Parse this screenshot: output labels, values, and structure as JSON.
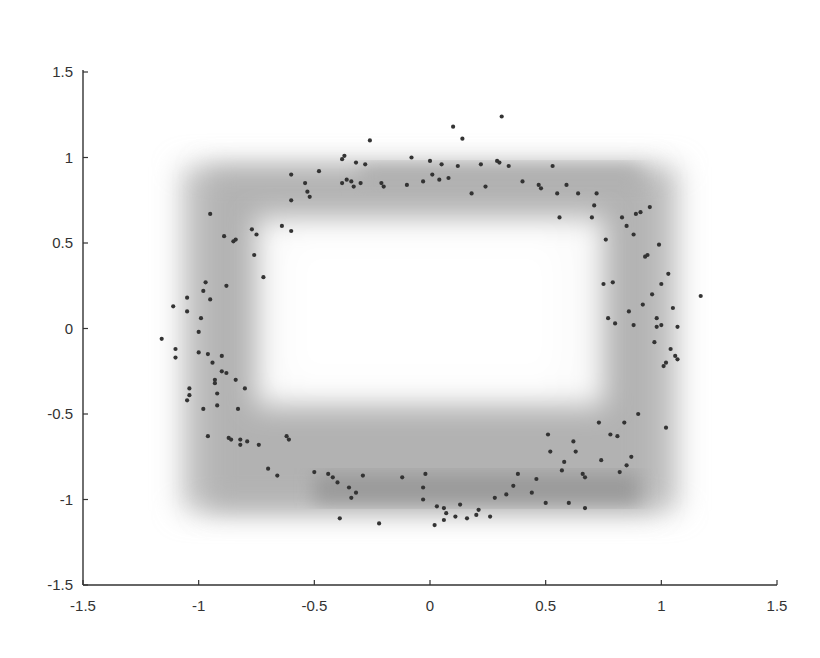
{
  "chart_data": {
    "type": "scatter",
    "title": "",
    "xlabel": "",
    "ylabel": "",
    "xlim": [
      -1.5,
      1.5
    ],
    "ylim": [
      -1.5,
      1.5
    ],
    "grid": false,
    "legend": null,
    "x_ticks": [
      -1.5,
      -1,
      -0.5,
      0,
      0.5,
      1,
      1.5
    ],
    "x_tick_labels": [
      "-1.5",
      "-1",
      "-0.5",
      "0",
      "0.5",
      "1",
      "1.5"
    ],
    "y_ticks": [
      -1.5,
      -1,
      -0.5,
      0,
      0.5,
      1,
      1.5
    ],
    "y_tick_labels": [
      "-1.5",
      "-1",
      "-0.5",
      "0",
      "0.5",
      "1",
      "1.5"
    ],
    "background_density": {
      "description": "blurred gray square-ring density centered at origin",
      "outer_extent": [
        -1.1,
        1.1,
        -1.1,
        0.98
      ],
      "inner_clear": [
        -0.75,
        0.75,
        -0.45,
        0.65
      ],
      "color": "#9a9a9a"
    },
    "marker_color": "#333333",
    "points": [
      [
        -1.16,
        -0.06
      ],
      [
        -1.11,
        0.13
      ],
      [
        -1.1,
        -0.12
      ],
      [
        -1.1,
        -0.17
      ],
      [
        -1.05,
        0.18
      ],
      [
        -1.05,
        0.1
      ],
      [
        -1.04,
        -0.35
      ],
      [
        -1.04,
        -0.39
      ],
      [
        -1.05,
        -0.42
      ],
      [
        -1.0,
        -0.14
      ],
      [
        -1.0,
        -0.02
      ],
      [
        -0.99,
        0.06
      ],
      [
        -0.98,
        0.22
      ],
      [
        -0.97,
        0.27
      ],
      [
        -0.98,
        -0.47
      ],
      [
        -0.96,
        -0.15
      ],
      [
        -0.96,
        -0.63
      ],
      [
        -0.95,
        0.67
      ],
      [
        -0.95,
        0.17
      ],
      [
        -0.94,
        -0.2
      ],
      [
        -0.93,
        -0.3
      ],
      [
        -0.93,
        -0.32
      ],
      [
        -0.92,
        -0.38
      ],
      [
        -0.92,
        -0.45
      ],
      [
        -0.9,
        -0.16
      ],
      [
        -0.9,
        -0.25
      ],
      [
        -0.89,
        0.54
      ],
      [
        -0.88,
        0.25
      ],
      [
        -0.88,
        -0.26
      ],
      [
        -0.87,
        -0.64
      ],
      [
        -0.86,
        -0.65
      ],
      [
        -0.85,
        0.51
      ],
      [
        -0.84,
        0.52
      ],
      [
        -0.84,
        -0.3
      ],
      [
        -0.83,
        -0.47
      ],
      [
        -0.82,
        -0.68
      ],
      [
        -0.82,
        -0.65
      ],
      [
        -0.8,
        -0.35
      ],
      [
        -0.79,
        -0.66
      ],
      [
        -0.77,
        0.58
      ],
      [
        -0.76,
        0.43
      ],
      [
        -0.75,
        0.55
      ],
      [
        -0.74,
        -0.68
      ],
      [
        -0.72,
        0.3
      ],
      [
        -0.7,
        -0.82
      ],
      [
        -0.66,
        -0.86
      ],
      [
        -0.64,
        0.6
      ],
      [
        -0.62,
        -0.63
      ],
      [
        -0.61,
        -0.65
      ],
      [
        -0.6,
        0.57
      ],
      [
        -0.6,
        0.9
      ],
      [
        -0.6,
        0.75
      ],
      [
        -0.54,
        0.85
      ],
      [
        -0.53,
        0.8
      ],
      [
        -0.52,
        0.77
      ],
      [
        -0.5,
        -0.84
      ],
      [
        -0.48,
        0.92
      ],
      [
        -0.44,
        -0.85
      ],
      [
        -0.42,
        -0.87
      ],
      [
        -0.4,
        -0.9
      ],
      [
        -0.39,
        -1.11
      ],
      [
        -0.38,
        0.85
      ],
      [
        -0.38,
        0.99
      ],
      [
        -0.37,
        1.01
      ],
      [
        -0.36,
        0.87
      ],
      [
        -0.35,
        -0.93
      ],
      [
        -0.34,
        -0.99
      ],
      [
        -0.34,
        0.86
      ],
      [
        -0.33,
        0.83
      ],
      [
        -0.32,
        -0.96
      ],
      [
        -0.32,
        0.97
      ],
      [
        -0.3,
        0.85
      ],
      [
        -0.29,
        -0.86
      ],
      [
        -0.28,
        0.96
      ],
      [
        -0.26,
        1.1
      ],
      [
        -0.22,
        -1.14
      ],
      [
        -0.21,
        0.85
      ],
      [
        -0.2,
        0.83
      ],
      [
        -0.12,
        -0.87
      ],
      [
        -0.1,
        0.84
      ],
      [
        -0.08,
        1.0
      ],
      [
        -0.03,
        -1.0
      ],
      [
        -0.03,
        -0.93
      ],
      [
        -0.03,
        0.86
      ],
      [
        -0.02,
        -0.85
      ],
      [
        0.0,
        0.98
      ],
      [
        0.01,
        0.9
      ],
      [
        0.02,
        -1.15
      ],
      [
        0.03,
        -1.04
      ],
      [
        0.04,
        0.87
      ],
      [
        0.05,
        0.96
      ],
      [
        0.06,
        -1.05
      ],
      [
        0.06,
        -1.12
      ],
      [
        0.07,
        -1.08
      ],
      [
        0.08,
        0.88
      ],
      [
        0.1,
        1.18
      ],
      [
        0.11,
        -1.1
      ],
      [
        0.12,
        0.95
      ],
      [
        0.13,
        -1.03
      ],
      [
        0.14,
        1.11
      ],
      [
        0.16,
        -1.11
      ],
      [
        0.18,
        0.79
      ],
      [
        0.2,
        -1.09
      ],
      [
        0.21,
        -1.06
      ],
      [
        0.22,
        0.96
      ],
      [
        0.24,
        0.83
      ],
      [
        0.26,
        -1.1
      ],
      [
        0.28,
        -0.99
      ],
      [
        0.29,
        0.98
      ],
      [
        0.3,
        0.97
      ],
      [
        0.31,
        1.24
      ],
      [
        0.33,
        -0.97
      ],
      [
        0.34,
        0.95
      ],
      [
        0.36,
        -0.92
      ],
      [
        0.38,
        -0.85
      ],
      [
        0.4,
        0.86
      ],
      [
        0.44,
        -0.96
      ],
      [
        0.46,
        -0.88
      ],
      [
        0.47,
        0.84
      ],
      [
        0.48,
        0.82
      ],
      [
        0.5,
        -1.02
      ],
      [
        0.51,
        -0.62
      ],
      [
        0.52,
        -0.72
      ],
      [
        0.53,
        0.95
      ],
      [
        0.55,
        0.79
      ],
      [
        0.56,
        0.65
      ],
      [
        0.57,
        -0.83
      ],
      [
        0.58,
        -0.78
      ],
      [
        0.59,
        0.84
      ],
      [
        0.6,
        -1.02
      ],
      [
        0.62,
        -0.66
      ],
      [
        0.63,
        -0.72
      ],
      [
        0.64,
        0.79
      ],
      [
        0.66,
        -0.85
      ],
      [
        0.67,
        -0.87
      ],
      [
        0.67,
        -1.05
      ],
      [
        0.7,
        0.65
      ],
      [
        0.71,
        0.72
      ],
      [
        0.72,
        0.79
      ],
      [
        0.73,
        -0.55
      ],
      [
        0.74,
        -0.77
      ],
      [
        0.75,
        0.26
      ],
      [
        0.76,
        0.52
      ],
      [
        0.77,
        0.06
      ],
      [
        0.78,
        -0.62
      ],
      [
        0.79,
        0.27
      ],
      [
        0.8,
        0.03
      ],
      [
        0.81,
        -0.63
      ],
      [
        0.82,
        -0.84
      ],
      [
        0.83,
        0.65
      ],
      [
        0.84,
        -0.55
      ],
      [
        0.85,
        0.6
      ],
      [
        0.85,
        -0.8
      ],
      [
        0.86,
        0.1
      ],
      [
        0.87,
        -0.75
      ],
      [
        0.88,
        0.55
      ],
      [
        0.88,
        0.02
      ],
      [
        0.89,
        0.67
      ],
      [
        0.9,
        -0.5
      ],
      [
        0.91,
        0.68
      ],
      [
        0.92,
        0.14
      ],
      [
        0.93,
        0.42
      ],
      [
        0.94,
        0.43
      ],
      [
        0.95,
        0.71
      ],
      [
        0.96,
        0.2
      ],
      [
        0.97,
        -0.08
      ],
      [
        0.98,
        0.01
      ],
      [
        0.98,
        0.06
      ],
      [
        0.99,
        0.49
      ],
      [
        1.0,
        0.26
      ],
      [
        1.0,
        0.02
      ],
      [
        1.01,
        -0.22
      ],
      [
        1.02,
        -0.2
      ],
      [
        1.02,
        -0.58
      ],
      [
        1.03,
        0.32
      ],
      [
        1.04,
        -0.12
      ],
      [
        1.05,
        0.12
      ],
      [
        1.06,
        -0.16
      ],
      [
        1.07,
        0.01
      ],
      [
        1.07,
        -0.18
      ],
      [
        1.17,
        0.19
      ]
    ]
  }
}
